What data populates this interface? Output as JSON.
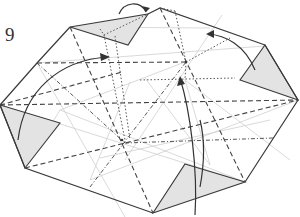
{
  "diagram": {
    "type": "origami-folding-step",
    "step_number": "9",
    "colors": {
      "edge": "#3a3a3a",
      "crease_light": "#c8c8c8",
      "shaded_flap": "#e2e2e2",
      "valley_fold": "#444444",
      "mountain_fold": "#444444",
      "hidden_line": "#555555",
      "arrow": "#333333"
    },
    "shaded_flaps": [
      "top",
      "right",
      "bottom",
      "left"
    ],
    "arrows": [
      "top-flip",
      "upper-left-curve",
      "right-curve",
      "center-up-curve",
      "bottom-curve"
    ]
  }
}
